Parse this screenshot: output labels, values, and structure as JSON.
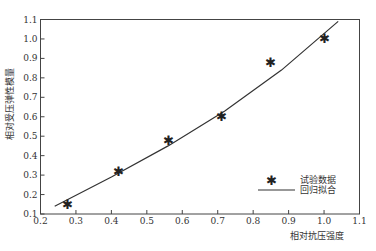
{
  "chart_data": {
    "type": "scatter",
    "title": "",
    "xlabel": "相对抗压强度",
    "ylabel": "相对受压弹性模量",
    "xlim": [
      0.2,
      1.1
    ],
    "ylim": [
      0.1,
      1.1
    ],
    "xticks": [
      "0.2",
      "0.3",
      "0.4",
      "0.5",
      "0.6",
      "0.7",
      "0.8",
      "0.9",
      "1.0",
      "1.1"
    ],
    "yticks": [
      "0.1",
      "0.2",
      "0.3",
      "0.4",
      "0.5",
      "0.6",
      "0.7",
      "0.8",
      "0.9",
      "1.0",
      "1.1"
    ],
    "grid": false,
    "legend_position": "lower right",
    "series": [
      {
        "name": "试验数据",
        "kind": "scatter",
        "marker": "*",
        "x": [
          0.275,
          0.42,
          0.56,
          0.71,
          0.85,
          1.0
        ],
        "y": [
          0.15,
          0.32,
          0.48,
          0.6,
          0.88,
          1.0
        ]
      },
      {
        "name": "回归拟合",
        "kind": "line",
        "x": [
          0.24,
          0.4,
          0.56,
          0.72,
          0.88,
          1.04
        ],
        "y": [
          0.14,
          0.29,
          0.45,
          0.63,
          0.84,
          1.09
        ]
      }
    ]
  },
  "legend": {
    "scatter_label": "试验数据",
    "line_label": "回归拟合"
  },
  "axes": {
    "xlabel": "相对抗压强度",
    "ylabel": "相对受压弹性模量"
  }
}
